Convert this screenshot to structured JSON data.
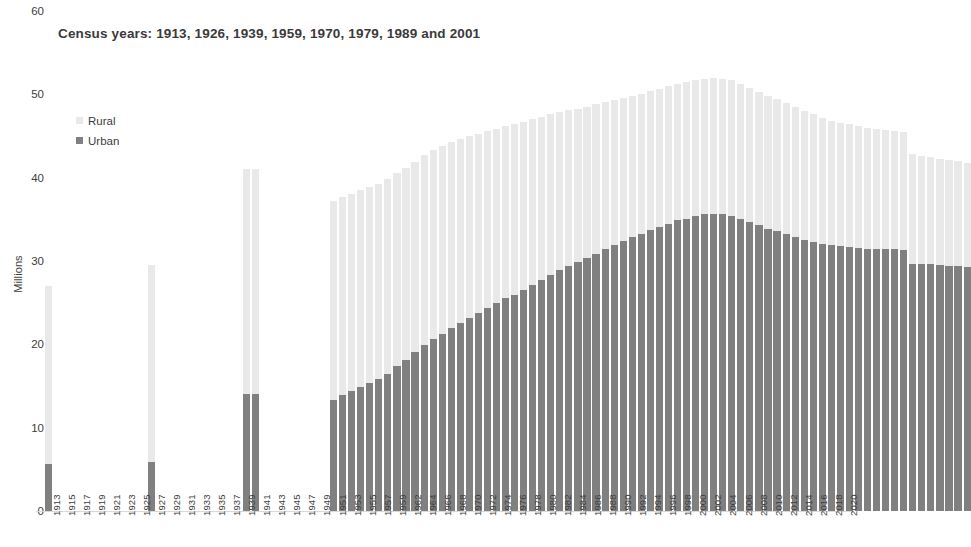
{
  "chart": {
    "title": "Census years: 1913, 1926, 1939, 1959, 1970, 1979, 1989 and 2001",
    "y_axis_title": "Millions",
    "y_ticks": [
      "0",
      "10",
      "20",
      "30",
      "40",
      "50",
      "60"
    ],
    "legend": [
      {
        "label": "Rural",
        "color": "#e9e9e9",
        "swatch_name": "legend-swatch-rural"
      },
      {
        "label": "Urban",
        "color": "#808080",
        "swatch_name": "legend-swatch-urban"
      }
    ]
  },
  "colors": {
    "rural": "#e9e9e9",
    "urban": "#808080",
    "text": "#3d3d3d",
    "axis": "#d9d9d9",
    "background": "#ffffff"
  },
  "chart_data": {
    "type": "bar",
    "subtype": "stacked-column",
    "title": "Census years: 1913, 1926, 1939, 1959, 1970, 1979, 1989 and 2001",
    "xlabel": "",
    "ylabel": "Millions",
    "ylim": [
      0,
      60
    ],
    "ytick_step": 10,
    "grid": false,
    "legend_position": "inside-top-left",
    "x_tick_labels": [
      "1913",
      "1915",
      "1917",
      "1919",
      "1921",
      "1923",
      "1925",
      "1927",
      "1929",
      "1931",
      "1933",
      "1935",
      "1937",
      "1939",
      "1941",
      "1943",
      "1945",
      "1947",
      "1949",
      "1951",
      "1953",
      "1955",
      "1957",
      "1959",
      "1962",
      "1964",
      "1966",
      "1968",
      "1970",
      "1972",
      "1974",
      "1976",
      "1978",
      "1980",
      "1982",
      "1984",
      "1986",
      "1988",
      "1990",
      "1992",
      "1994",
      "1996",
      "1998",
      "2000",
      "2002",
      "2004",
      "2006",
      "2008",
      "2010",
      "2012",
      "2014",
      "2016",
      "2018",
      "2020"
    ],
    "series": [
      {
        "name": "Urban",
        "color": "#808080"
      },
      {
        "name": "Rural",
        "color": "#e9e9e9"
      }
    ],
    "points": [
      {
        "year": "1913",
        "urban": 5.6,
        "rural": 21.4,
        "total": 27.0
      },
      {
        "year": "1926",
        "urban": 5.9,
        "rural": 23.6,
        "total": 29.5
      },
      {
        "year": "1939",
        "urban": 14.0,
        "rural": 27.0,
        "total": 41.0
      },
      {
        "year": "1940",
        "urban": 14.1,
        "rural": 27.0,
        "total": 41.1
      },
      {
        "year": "1950",
        "urban": 13.3,
        "rural": 23.9,
        "total": 37.2
      },
      {
        "year": "1951",
        "urban": 13.9,
        "rural": 23.8,
        "total": 37.7
      },
      {
        "year": "1952",
        "urban": 14.4,
        "rural": 23.7,
        "total": 38.1
      },
      {
        "year": "1953",
        "urban": 14.9,
        "rural": 23.6,
        "total": 38.5
      },
      {
        "year": "1954",
        "urban": 15.4,
        "rural": 23.5,
        "total": 38.9
      },
      {
        "year": "1955",
        "urban": 15.9,
        "rural": 23.4,
        "total": 39.3
      },
      {
        "year": "1956",
        "urban": 16.5,
        "rural": 23.3,
        "total": 39.8
      },
      {
        "year": "1957",
        "urban": 17.4,
        "rural": 23.2,
        "total": 40.6
      },
      {
        "year": "1958",
        "urban": 18.1,
        "rural": 23.1,
        "total": 41.2
      },
      {
        "year": "1959",
        "urban": 19.1,
        "rural": 22.8,
        "total": 41.9
      },
      {
        "year": "1960",
        "urban": 19.9,
        "rural": 22.8,
        "total": 42.7
      },
      {
        "year": "1961",
        "urban": 20.6,
        "rural": 22.7,
        "total": 43.3
      },
      {
        "year": "1962",
        "urban": 21.3,
        "rural": 22.5,
        "total": 43.8
      },
      {
        "year": "1963",
        "urban": 22.0,
        "rural": 22.3,
        "total": 44.3
      },
      {
        "year": "1964",
        "urban": 22.6,
        "rural": 22.1,
        "total": 44.7
      },
      {
        "year": "1965",
        "urban": 23.2,
        "rural": 21.8,
        "total": 45.0
      },
      {
        "year": "1966",
        "urban": 23.8,
        "rural": 21.5,
        "total": 45.3
      },
      {
        "year": "1967",
        "urban": 24.4,
        "rural": 21.2,
        "total": 45.6
      },
      {
        "year": "1968",
        "urban": 25.0,
        "rural": 20.9,
        "total": 45.9
      },
      {
        "year": "1969",
        "urban": 25.6,
        "rural": 20.6,
        "total": 46.2
      },
      {
        "year": "1970",
        "urban": 25.9,
        "rural": 20.5,
        "total": 46.4
      },
      {
        "year": "1971",
        "urban": 26.5,
        "rural": 20.2,
        "total": 46.7
      },
      {
        "year": "1972",
        "urban": 27.1,
        "rural": 19.9,
        "total": 47.0
      },
      {
        "year": "1973",
        "urban": 27.7,
        "rural": 19.6,
        "total": 47.3
      },
      {
        "year": "1974",
        "urban": 28.3,
        "rural": 19.3,
        "total": 47.6
      },
      {
        "year": "1975",
        "urban": 28.9,
        "rural": 19.0,
        "total": 47.9
      },
      {
        "year": "1976",
        "urban": 29.4,
        "rural": 18.7,
        "total": 48.1
      },
      {
        "year": "1977",
        "urban": 29.9,
        "rural": 18.4,
        "total": 48.3
      },
      {
        "year": "1978",
        "urban": 30.4,
        "rural": 18.1,
        "total": 48.5
      },
      {
        "year": "1979",
        "urban": 30.9,
        "rural": 17.9,
        "total": 48.8
      },
      {
        "year": "1980",
        "urban": 31.4,
        "rural": 17.7,
        "total": 49.1
      },
      {
        "year": "1981",
        "urban": 31.9,
        "rural": 17.4,
        "total": 49.3
      },
      {
        "year": "1982",
        "urban": 32.4,
        "rural": 17.2,
        "total": 49.6
      },
      {
        "year": "1983",
        "urban": 32.9,
        "rural": 16.9,
        "total": 49.8
      },
      {
        "year": "1984",
        "urban": 33.3,
        "rural": 16.8,
        "total": 50.1
      },
      {
        "year": "1985",
        "urban": 33.7,
        "rural": 16.7,
        "total": 50.4
      },
      {
        "year": "1986",
        "urban": 34.1,
        "rural": 16.6,
        "total": 50.7
      },
      {
        "year": "1987",
        "urban": 34.5,
        "rural": 16.5,
        "total": 51.0
      },
      {
        "year": "1988",
        "urban": 34.9,
        "rural": 16.4,
        "total": 51.3
      },
      {
        "year": "1989",
        "urban": 35.1,
        "rural": 16.4,
        "total": 51.5
      },
      {
        "year": "1990",
        "urban": 35.4,
        "rural": 16.3,
        "total": 51.7
      },
      {
        "year": "1991",
        "urban": 35.6,
        "rural": 16.3,
        "total": 51.9
      },
      {
        "year": "1992",
        "urban": 35.7,
        "rural": 16.3,
        "total": 52.0
      },
      {
        "year": "1993",
        "urban": 35.6,
        "rural": 16.3,
        "total": 51.9
      },
      {
        "year": "1994",
        "urban": 35.4,
        "rural": 16.3,
        "total": 51.7
      },
      {
        "year": "1995",
        "urban": 35.1,
        "rural": 16.2,
        "total": 51.3
      },
      {
        "year": "1996",
        "urban": 34.7,
        "rural": 16.1,
        "total": 50.8
      },
      {
        "year": "1997",
        "urban": 34.3,
        "rural": 16.0,
        "total": 50.3
      },
      {
        "year": "1998",
        "urban": 33.9,
        "rural": 15.9,
        "total": 49.8
      },
      {
        "year": "1999",
        "urban": 33.6,
        "rural": 15.8,
        "total": 49.4
      },
      {
        "year": "2000",
        "urban": 33.3,
        "rural": 15.7,
        "total": 49.0
      },
      {
        "year": "2001",
        "urban": 32.9,
        "rural": 15.6,
        "total": 48.5
      },
      {
        "year": "2002",
        "urban": 32.5,
        "rural": 15.5,
        "total": 48.0
      },
      {
        "year": "2003",
        "urban": 32.3,
        "rural": 15.3,
        "total": 47.6
      },
      {
        "year": "2004",
        "urban": 32.1,
        "rural": 15.1,
        "total": 47.2
      },
      {
        "year": "2005",
        "urban": 31.9,
        "rural": 14.9,
        "total": 46.8
      },
      {
        "year": "2006",
        "urban": 31.8,
        "rural": 14.8,
        "total": 46.6
      },
      {
        "year": "2007",
        "urban": 31.7,
        "rural": 14.7,
        "total": 46.4
      },
      {
        "year": "2008",
        "urban": 31.6,
        "rural": 14.6,
        "total": 46.2
      },
      {
        "year": "2009",
        "urban": 31.5,
        "rural": 14.5,
        "total": 46.0
      },
      {
        "year": "2010",
        "urban": 31.4,
        "rural": 14.4,
        "total": 45.8
      },
      {
        "year": "2011",
        "urban": 31.4,
        "rural": 14.3,
        "total": 45.7
      },
      {
        "year": "2012",
        "urban": 31.4,
        "rural": 14.2,
        "total": 45.6
      },
      {
        "year": "2013",
        "urban": 31.3,
        "rural": 14.2,
        "total": 45.5
      },
      {
        "year": "2014",
        "urban": 29.7,
        "rural": 13.1,
        "total": 42.8
      },
      {
        "year": "2015",
        "urban": 29.6,
        "rural": 13.0,
        "total": 42.6
      },
      {
        "year": "2016",
        "urban": 29.6,
        "rural": 12.9,
        "total": 42.5
      },
      {
        "year": "2017",
        "urban": 29.5,
        "rural": 12.8,
        "total": 42.3
      },
      {
        "year": "2018",
        "urban": 29.4,
        "rural": 12.7,
        "total": 42.1
      },
      {
        "year": "2019",
        "urban": 29.4,
        "rural": 12.6,
        "total": 42.0
      },
      {
        "year": "2020",
        "urban": 29.3,
        "rural": 12.5,
        "total": 41.8
      }
    ]
  },
  "geometry": {
    "baseline_y": 511,
    "px_per_million": 8.333,
    "plot_left": 36,
    "bar_width": 7.2,
    "bar_pitch": 9.05,
    "early_bar_x": {
      "1913": 45,
      "1926": 148,
      "1939": 243,
      "1940": 252
    },
    "main_series_start_x": 330
  }
}
